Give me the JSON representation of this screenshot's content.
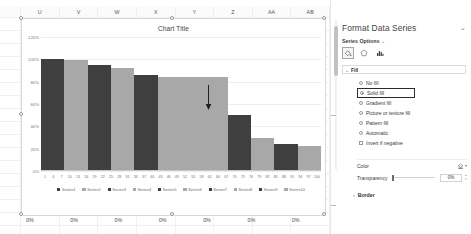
{
  "spreadsheet": {
    "column_headers": [
      "",
      "U",
      "V",
      "W",
      "X",
      "Y",
      "Z",
      "AA",
      "AB"
    ],
    "bottom_row_values": [
      "",
      "0%",
      "0%",
      "0%",
      "0%",
      "0%",
      "0%",
      "0%"
    ]
  },
  "chart_data": {
    "type": "bar",
    "title": "Chart Title",
    "xlabel": "",
    "ylabel": "",
    "ylim": [
      0,
      1.2
    ],
    "ytick_labels": [
      "120%",
      "100%",
      "80%",
      "60%",
      "40%",
      "20%",
      "0%"
    ],
    "ytick_values": [
      1.2,
      1.0,
      0.8,
      0.6,
      0.4,
      0.2,
      0.0
    ],
    "grid": true,
    "legend_position": "bottom",
    "x_tick_labels": [
      "1",
      "4",
      "7",
      "10",
      "13",
      "16",
      "19",
      "22",
      "25",
      "28",
      "31",
      "34",
      "37",
      "40",
      "43",
      "46",
      "49",
      "52",
      "55",
      "58",
      "61",
      "64",
      "67",
      "70",
      "73",
      "76",
      "79",
      "82",
      "85",
      "88",
      "91",
      "94",
      "97",
      "100"
    ],
    "categories": [
      "1",
      "4",
      "7",
      "10",
      "13",
      "16",
      "19",
      "22",
      "25",
      "28",
      "31",
      "34",
      "37",
      "40",
      "43",
      "46",
      "49",
      "52",
      "55",
      "58",
      "61",
      "64",
      "67",
      "70",
      "73",
      "76",
      "79",
      "82",
      "85",
      "88",
      "91",
      "94",
      "97",
      "100"
    ],
    "series": [
      {
        "name": "Series1",
        "value": 1.0,
        "color": "#3f3f3f"
      },
      {
        "name": "Series2",
        "value": 0.99,
        "color": "#a8a8a8"
      },
      {
        "name": "Series3",
        "value": 0.95,
        "color": "#3f3f3f"
      },
      {
        "name": "Series4",
        "value": 0.92,
        "color": "#a8a8a8"
      },
      {
        "name": "Series5",
        "value": 0.86,
        "color": "#3f3f3f"
      },
      {
        "name": "Series6",
        "value": 0.84,
        "color": "#a8a8a8"
      },
      {
        "name": "Series7",
        "value": 0.84,
        "color": "#a8a8a8"
      },
      {
        "name": "Series8",
        "value": 0.84,
        "color": "#a8a8a8"
      },
      {
        "name": "Series9",
        "value": 0.5,
        "color": "#3f3f3f"
      },
      {
        "name": "Series10",
        "value": 0.3,
        "color": "#a8a8a8"
      },
      {
        "name": "Series11",
        "value": 0.24,
        "color": "#3f3f3f"
      },
      {
        "name": "Series12",
        "value": 0.22,
        "color": "#a8a8a8"
      }
    ],
    "legend_entries": [
      {
        "label": "Series1",
        "color": "#3f3f3f"
      },
      {
        "label": "Series2",
        "color": "#a8a8a8"
      },
      {
        "label": "Series3",
        "color": "#3f3f3f"
      },
      {
        "label": "Series4",
        "color": "#a8a8a8"
      },
      {
        "label": "Series5",
        "color": "#3f3f3f"
      },
      {
        "label": "Series6",
        "color": "#a8a8a8"
      },
      {
        "label": "Series7",
        "color": "#3f3f3f"
      },
      {
        "label": "Series8",
        "color": "#a8a8a8"
      },
      {
        "label": "Series9",
        "color": "#3f3f3f"
      },
      {
        "label": "Series10",
        "color": "#a8a8a8"
      }
    ],
    "annotation": {
      "type": "down-arrow",
      "at_series": "Series6"
    }
  },
  "pane": {
    "title": "Format Data Series",
    "collapse_icon": "chevron-down-icon",
    "section_selector": {
      "label": "Series Options",
      "chevron": "chevron-down-icon"
    },
    "tabs": [
      {
        "name": "fill-and-line",
        "icon": "paint-bucket-icon",
        "selected": true
      },
      {
        "name": "effects",
        "icon": "pentagon-effects-icon",
        "selected": false
      },
      {
        "name": "series-options",
        "icon": "bar-chart-icon",
        "selected": false
      }
    ],
    "fill_section": {
      "label": "Fill",
      "expanded": true,
      "chevron": "chevron-down-icon",
      "options": [
        {
          "label": "No fill",
          "type": "radio",
          "selected": false,
          "highlighted": false
        },
        {
          "label": "Solid fill",
          "type": "radio",
          "selected": true,
          "highlighted": true
        },
        {
          "label": "Gradient fill",
          "type": "radio",
          "selected": false,
          "highlighted": false
        },
        {
          "label": "Picture or texture fill",
          "type": "radio",
          "selected": false,
          "highlighted": false
        },
        {
          "label": "Pattern fill",
          "type": "radio",
          "selected": false,
          "highlighted": false
        },
        {
          "label": "Automatic",
          "type": "radio",
          "selected": false,
          "highlighted": false
        },
        {
          "label": "Invert if negative",
          "type": "checkbox",
          "selected": false,
          "highlighted": false
        }
      ],
      "color": {
        "label": "Color",
        "icon": "fill-color-icon",
        "dropdown": "chevron-down-icon"
      },
      "transparency": {
        "label": "Transparency",
        "value": "0%",
        "slider_position": 0
      }
    },
    "border_section": {
      "label": "Border",
      "expanded": false,
      "chevron": "chevron-right-icon"
    }
  }
}
